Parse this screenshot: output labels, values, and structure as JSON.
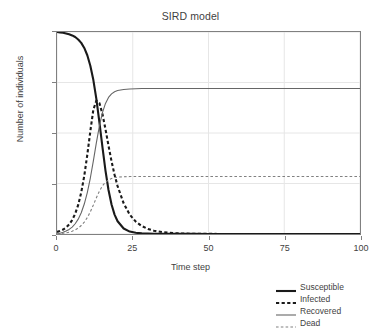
{
  "chart_data": {
    "type": "line",
    "title": "SIRD model",
    "xlabel": "Time step",
    "ylabel": "Number of individuals",
    "xlim": [
      0,
      100
    ],
    "ylim": [
      0,
      1000
    ],
    "xticks": [
      0,
      25,
      50,
      75,
      100
    ],
    "xtick_labels": [
      "0",
      "25",
      "50",
      "75",
      "100"
    ],
    "yticks": [
      0,
      250,
      500,
      750,
      1000
    ],
    "ytick_labels": [
      "0",
      "250",
      "500",
      "750",
      "1,000"
    ],
    "grid": true,
    "legend_position": "bottom-right-outside",
    "x": [
      0,
      1,
      2,
      3,
      4,
      5,
      6,
      7,
      8,
      9,
      10,
      11,
      12,
      13,
      14,
      15,
      16,
      17,
      18,
      19,
      20,
      22,
      24,
      26,
      28,
      30,
      32,
      35,
      40,
      45,
      50,
      55,
      60,
      65,
      70,
      75,
      80,
      85,
      90,
      95,
      100
    ],
    "series": [
      {
        "name": "Susceptible",
        "style": "solid",
        "width": 2.1,
        "color": "#1a1a1a",
        "values": [
          1000,
          998,
          996,
          993,
          989,
          983,
          975,
          963,
          946,
          921,
          885,
          833,
          762,
          668,
          553,
          430,
          314,
          218,
          146,
          96,
          63,
          27,
          12,
          6,
          3,
          2,
          1.5,
          1,
          0.6,
          0.4,
          0.3,
          0.2,
          0.2,
          0.1,
          0.1,
          0.1,
          0.1,
          0.1,
          0.1,
          0.1,
          0.1
        ]
      },
      {
        "name": "Infected",
        "style": "dashed",
        "width": 2.1,
        "color": "#1a1a1a",
        "values": [
          10,
          15,
          22,
          32,
          47,
          69,
          100,
          144,
          206,
          288,
          392,
          509,
          616,
          660,
          648,
          594,
          519,
          437,
          360,
          293,
          237,
          152,
          96,
          61,
          39,
          25,
          16,
          9,
          3,
          1.2,
          0.5,
          0.2,
          0.1,
          0.05,
          0.02,
          0.01,
          0.01,
          0,
          0,
          0,
          0
        ]
      },
      {
        "name": "Recovered",
        "style": "solid",
        "width": 1.1,
        "color": "#666666",
        "values": [
          0,
          6,
          14,
          24,
          38,
          58,
          86,
          125,
          179,
          252,
          349,
          472,
          616,
          766,
          906,
          1023,
          0,
          0,
          0,
          0,
          0,
          0,
          0,
          0,
          0,
          0,
          0,
          0,
          0,
          0,
          0,
          0,
          0,
          0,
          0,
          0,
          0,
          0,
          0,
          0,
          0
        ],
        "plot_values": [
          0,
          5,
          11,
          19,
          30,
          45,
          67,
          97,
          139,
          196,
          271,
          366,
          478,
          597,
          707,
          794,
          854,
          893,
          916,
          930,
          938,
          945,
          948,
          950,
          951,
          951,
          951,
          951,
          951,
          951,
          951,
          951,
          951,
          951,
          951,
          951,
          951,
          951,
          951,
          951,
          951
        ],
        "final_value": 720
      },
      {
        "name": "Dead",
        "style": "dashed",
        "width": 1.1,
        "color": "#808080",
        "values": [
          0,
          2,
          5,
          8,
          13,
          20,
          29,
          42,
          60,
          84,
          116,
          157,
          205,
          256,
          303,
          340,
          366,
          383,
          393,
          399,
          402,
          405,
          406,
          407,
          407,
          407,
          407,
          407,
          407,
          407,
          407,
          407,
          407,
          407,
          407,
          407,
          407,
          407,
          407,
          407,
          407
        ],
        "final_value": 285
      }
    ],
    "annotations": {
      "infected_peak_value": 660,
      "infected_peak_time": 13,
      "recovered_plateau": 720,
      "dead_plateau": 285,
      "susceptible_start": 1000
    }
  },
  "legend": {
    "items": [
      {
        "label": "Susceptible",
        "style": "solid-thick"
      },
      {
        "label": "Infected",
        "style": "dashed-thick"
      },
      {
        "label": "Recovered",
        "style": "solid-thin"
      },
      {
        "label": "Dead",
        "style": "dashed-thin"
      }
    ]
  },
  "colors": {
    "susceptible": "#1a1a1a",
    "infected": "#1a1a1a",
    "recovered": "#666666",
    "dead": "#808080",
    "grid": "#e6e6e6",
    "frame": "#808080",
    "text": "#3f3f3f"
  }
}
